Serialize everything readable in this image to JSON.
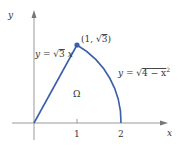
{
  "diagram": {
    "axes": {
      "x_label": "x",
      "y_label": "y",
      "tick_1": "1",
      "tick_2": "2"
    },
    "curves": {
      "line_label_prefix": "y = ",
      "line_label_rad": "3",
      "line_label_suffix": " x",
      "arc_label_prefix": "y = ",
      "arc_label_rad": "4 − x",
      "arc_label_exp": "2"
    },
    "point": {
      "label_prefix": "(1, ",
      "label_rad": "3",
      "label_suffix": ")"
    },
    "region_label": "Ω",
    "colors": {
      "curve": "#3b5fa8",
      "axis": "#888888",
      "text": "#333333"
    }
  }
}
